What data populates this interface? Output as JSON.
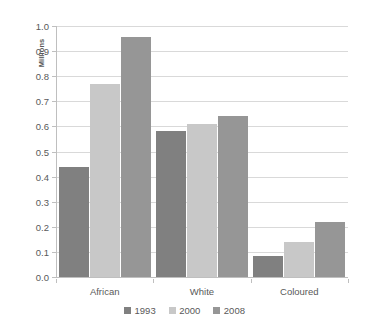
{
  "chart_data": {
    "type": "bar",
    "title": "",
    "subtitle": "",
    "xlabel": "",
    "ylabel": "Millions",
    "categories": [
      "African",
      "White",
      "Coloured"
    ],
    "series": [
      {
        "name": "1993",
        "color": "#808080",
        "values": [
          0.44,
          0.58,
          0.085
        ]
      },
      {
        "name": "2000",
        "color": "#c8c8c8",
        "values": [
          0.77,
          0.61,
          0.14
        ]
      },
      {
        "name": "2008",
        "color": "#969696",
        "values": [
          0.955,
          0.64,
          0.22
        ]
      }
    ],
    "ylim": [
      0.0,
      1.0
    ],
    "ytick_step": 0.1,
    "ytick_labels": [
      "1.0",
      "0.9",
      "0.8",
      "0.7",
      "0.6",
      "0.5",
      "0.4",
      "0.3",
      "0.2",
      "0.1",
      "0.0"
    ],
    "ytick_values": [
      1.0,
      0.9,
      0.8,
      0.7,
      0.6,
      0.5,
      0.4,
      0.3,
      0.2,
      0.1,
      0.0
    ],
    "grid": true,
    "grid_axis": "y",
    "legend_position": "bottom",
    "legend_entries": [
      "1993",
      "2000",
      "2008"
    ],
    "grid_color": "#d9d9d9",
    "axis_color": "#bfbfbf",
    "text_color": "#595959",
    "background_color": "#ffffff"
  }
}
